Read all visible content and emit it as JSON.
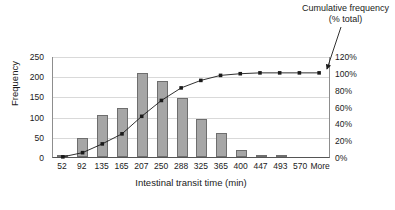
{
  "annotation": {
    "line1": "Cumulative frequency",
    "line2": "(% total)"
  },
  "footnote": "",
  "chart_data": {
    "type": "bar",
    "title": "",
    "subtitle": "",
    "xlabel": "Intestinal transit time (min)",
    "ylabel": "Frequency",
    "y2label": "",
    "grid": true,
    "legend_position": "annotation-arrow",
    "categories": [
      "52",
      "92",
      "135",
      "165",
      "207",
      "250",
      "288",
      "325",
      "365",
      "400",
      "447",
      "493",
      "570",
      "More"
    ],
    "ylim": [
      0,
      250
    ],
    "yticks": [
      0,
      50,
      100,
      150,
      200,
      250
    ],
    "ytick_labels": [
      "0",
      "50",
      "100",
      "150",
      "200",
      "250"
    ],
    "y2lim": [
      0,
      120
    ],
    "y2ticks": [
      0,
      20,
      40,
      60,
      80,
      100,
      120
    ],
    "y2tick_labels": [
      "0%",
      "20%",
      "40%",
      "60%",
      "80%",
      "100%",
      "120%"
    ],
    "series": [
      {
        "name": "Frequency",
        "type": "bar",
        "axis": "left",
        "color": "#a6a6a6",
        "edge_color": "#6e6e6e",
        "values": [
          5,
          48,
          103,
          121,
          209,
          188,
          145,
          93,
          60,
          17,
          5,
          3,
          0,
          0
        ]
      },
      {
        "name": "Cumulative frequency (% total)",
        "type": "line",
        "axis": "right",
        "color": "#1a1a1a",
        "marker": "square",
        "values": [
          0.5,
          5.5,
          16,
          28,
          49,
          68,
          83,
          92,
          98,
          100,
          101,
          101,
          101,
          101
        ]
      }
    ],
    "annotations": [
      {
        "text": "Cumulative frequency (% total)",
        "target_category": "More",
        "target_series": "Cumulative frequency (% total)"
      }
    ]
  }
}
